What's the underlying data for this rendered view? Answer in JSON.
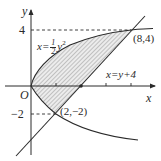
{
  "diagram": {
    "axes": {
      "x_label": "x",
      "y_label": "y",
      "origin_label": "O",
      "y_tick_labels": [
        "4",
        "−2"
      ],
      "x_ticks": [
        2,
        4,
        6,
        8
      ],
      "y_ticks": [
        4,
        -2
      ]
    },
    "curves": [
      {
        "name": "parabola",
        "equation_prefix": "x=",
        "frac_num": "1",
        "frac_den": "2",
        "equation_suffix": "y",
        "exponent": "2",
        "full": "x = (1/2) y^2"
      },
      {
        "name": "line",
        "equation": "x=y+4"
      }
    ],
    "points": [
      {
        "label": "(8,4)",
        "x": 8,
        "y": 4
      },
      {
        "label": "(2,−2)",
        "x": 2,
        "y": -2
      },
      {
        "label": "",
        "x": 4,
        "y": 0,
        "marker": "dot"
      }
    ],
    "shaded_region": "region bounded by x=(1/2)y^2 and x=y+4, hatched",
    "colors": {
      "line": "#2a2a2a",
      "hatch": "#8a8a8a",
      "fill": "#e6e6e6"
    }
  }
}
